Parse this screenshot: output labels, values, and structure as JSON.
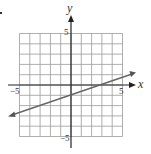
{
  "chart_data": {
    "type": "line",
    "title": "",
    "xlabel": "x",
    "ylabel": "y",
    "xlim": [
      -5,
      5
    ],
    "ylim": [
      -5,
      5
    ],
    "grid": true,
    "x_ticks_labeled": [
      "-5",
      "5"
    ],
    "y_ticks_labeled": [
      "5",
      "-5"
    ],
    "series": [
      {
        "name": "line",
        "equation": "y = (1/3)x - 1",
        "slope": 0.3333,
        "y_intercept": -1,
        "x_intercept": 3,
        "points": [
          [
            -6,
            -3
          ],
          [
            0,
            -1
          ],
          [
            3,
            0
          ],
          [
            6.2,
            1.07
          ]
        ],
        "arrows_both_ends": true
      }
    ]
  },
  "labels": {
    "x_axis": "x",
    "y_axis": "y",
    "x_min": "−5",
    "x_max": "5",
    "y_max": "5",
    "y_min": "−5"
  },
  "colors": {
    "grid": "#8a8a8a",
    "axis": "#222222",
    "line": "#666666"
  }
}
